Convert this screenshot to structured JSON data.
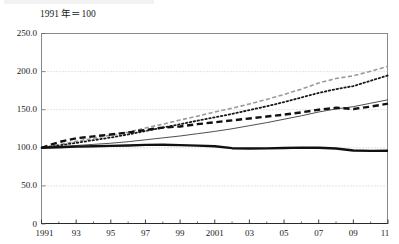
{
  "figure": {
    "unit_note": "1991 年＝100",
    "background_color": "#ffffff"
  },
  "chart_data": {
    "type": "line",
    "title": "",
    "subtitle": "",
    "annotations": [
      "1991 年＝100"
    ],
    "xlabel": "",
    "ylabel": "",
    "xlim": [
      1991,
      2011
    ],
    "ylim": [
      0,
      250
    ],
    "grid": true,
    "grid_color": "#bdbdbd",
    "grid_style": "dotted",
    "legend": "none",
    "y_ticks": [
      0,
      50,
      100,
      150,
      200,
      250
    ],
    "y_tick_labels": [
      "0",
      "50.0",
      "100.0",
      "150.0",
      "200.0",
      "250.0"
    ],
    "x_ticks": [
      1991,
      1993,
      1995,
      1997,
      1999,
      2001,
      2003,
      2005,
      2007,
      2009,
      2011
    ],
    "x_tick_labels": [
      "1991",
      "93",
      "95",
      "97",
      "99",
      "2001",
      "03",
      "05",
      "07",
      "09",
      "11"
    ],
    "x_minor_ticks": [
      1992,
      1994,
      1996,
      1998,
      2000,
      2002,
      2004,
      2006,
      2008,
      2010
    ],
    "x": [
      1991,
      1992,
      1993,
      1994,
      1995,
      1996,
      1997,
      1998,
      1999,
      2000,
      2001,
      2002,
      2003,
      2004,
      2005,
      2006,
      2007,
      2008,
      2009,
      2010,
      2011
    ],
    "series": [
      {
        "name": "series-gray-dashed",
        "style": "dashed",
        "color": "#9a9a9a",
        "width": 1.6,
        "values": [
          100.0,
          104.0,
          108.5,
          112.5,
          116.5,
          120.5,
          126.0,
          131.0,
          136.5,
          141.5,
          147.0,
          152.0,
          157.5,
          163.5,
          170.0,
          177.0,
          185.0,
          191.0,
          194.5,
          200.5,
          207.0
        ]
      },
      {
        "name": "series-black-dotted",
        "style": "dotted",
        "color": "#1a1a1a",
        "width": 1.8,
        "values": [
          100.0,
          103.0,
          106.5,
          110.0,
          113.5,
          117.5,
          122.0,
          126.5,
          131.0,
          135.5,
          140.0,
          144.5,
          149.5,
          154.5,
          160.0,
          166.0,
          172.0,
          177.0,
          181.0,
          188.0,
          195.0
        ]
      },
      {
        "name": "series-thin-solid",
        "style": "solid",
        "color": "#3a3a3a",
        "width": 0.9,
        "values": [
          100.0,
          101.5,
          103.0,
          104.5,
          106.0,
          108.0,
          110.5,
          113.0,
          115.5,
          118.5,
          121.5,
          125.0,
          129.0,
          133.0,
          137.5,
          142.0,
          147.0,
          151.0,
          154.0,
          158.5,
          163.0
        ]
      },
      {
        "name": "series-black-thick-dashed",
        "style": "dashed",
        "color": "#111111",
        "width": 2.4,
        "values": [
          100.0,
          107.5,
          112.5,
          115.0,
          117.5,
          120.0,
          123.5,
          126.5,
          128.0,
          131.0,
          133.5,
          136.0,
          138.5,
          141.0,
          143.5,
          146.5,
          150.0,
          152.5,
          151.0,
          154.0,
          158.0
        ]
      },
      {
        "name": "series-black-thick-solid",
        "style": "solid",
        "color": "#111111",
        "width": 2.4,
        "values": [
          100.0,
          100.8,
          101.5,
          102.0,
          102.5,
          103.0,
          103.8,
          104.0,
          103.5,
          102.8,
          102.0,
          99.5,
          99.0,
          99.2,
          99.8,
          100.2,
          100.0,
          99.0,
          96.5,
          96.0,
          96.2
        ]
      }
    ]
  }
}
